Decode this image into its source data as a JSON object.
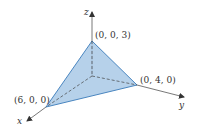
{
  "diagram": {
    "type": "3d-coordinate-plane-tetrahedron",
    "axes": {
      "x": {
        "label": "x"
      },
      "y": {
        "label": "y"
      },
      "z": {
        "label": "z"
      }
    },
    "vertices": [
      {
        "name": "x-intercept",
        "label": "(6, 0, 0)"
      },
      {
        "name": "y-intercept",
        "label": "(0, 4, 0)"
      },
      {
        "name": "z-intercept",
        "label": "(0, 0, 3)"
      }
    ],
    "colors": {
      "fill": "#a9c9e6",
      "edge": "#4a86c0",
      "axis": "#555555",
      "hidden_edge": "#444444"
    }
  }
}
